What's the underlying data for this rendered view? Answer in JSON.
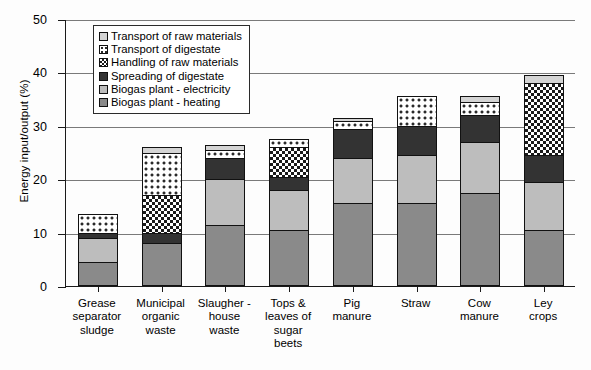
{
  "chart_data": {
    "type": "bar",
    "stacked": true,
    "title": "",
    "xlabel": "",
    "ylabel": "Energy input/output (%)",
    "ylim": [
      0,
      50
    ],
    "yticks": [
      0,
      10,
      20,
      30,
      40,
      50
    ],
    "grid": true,
    "legend_position": "upper left",
    "categories": [
      "Grease separator sludge",
      "Municipal organic waste",
      "Slaugher - house waste",
      "Tops & leaves of sugar beets",
      "Pig manure",
      "Straw",
      "Cow manure",
      "Ley crops"
    ],
    "series": [
      {
        "name": "Biogas plant - heating",
        "values": [
          4.5,
          8.0,
          11.5,
          10.5,
          15.5,
          15.5,
          17.5,
          10.5
        ]
      },
      {
        "name": "Biogas plant - electricity",
        "values": [
          4.5,
          0.0,
          8.5,
          7.5,
          8.5,
          9.0,
          9.5,
          9.0
        ]
      },
      {
        "name": "Spreading of digestate",
        "values": [
          1.0,
          2.0,
          4.0,
          2.5,
          5.5,
          5.5,
          5.0,
          5.0
        ]
      },
      {
        "name": "Handling of raw materials",
        "values": [
          0.0,
          7.0,
          0.0,
          5.5,
          0.0,
          0.0,
          0.0,
          13.5
        ]
      },
      {
        "name": "Transport of digestate",
        "values": [
          3.5,
          8.0,
          1.5,
          1.5,
          1.5,
          5.5,
          2.5,
          0.0
        ]
      },
      {
        "name": "Transport of raw materials",
        "values": [
          0.0,
          1.0,
          1.0,
          0.0,
          0.5,
          0.0,
          1.0,
          1.5
        ]
      }
    ],
    "totals": [
      13.5,
      26.0,
      26.5,
      27.5,
      31.5,
      35.5,
      35.5,
      39.5
    ]
  },
  "legend": {
    "items": [
      {
        "label": "Transport of raw materials",
        "pattern": "solid-light-gray",
        "color": "#d4d4d4"
      },
      {
        "label": "Transport of digestate",
        "pattern": "dots",
        "color": "#2a2a2a"
      },
      {
        "label": "Handling of raw materials",
        "pattern": "cross-hatch",
        "color": "#1a1a1a"
      },
      {
        "label": "Spreading of digestate",
        "pattern": "solid-dark",
        "color": "#333333"
      },
      {
        "label": "Biogas plant - electricity",
        "pattern": "solid-mid-gray",
        "color": "#bdbdbd"
      },
      {
        "label": "Biogas plant - heating",
        "pattern": "solid-gray",
        "color": "#8a8a8a"
      }
    ]
  },
  "axis": {
    "y_title": "Energy input/output (%)",
    "y_tick_labels": [
      "50",
      "40",
      "30",
      "20",
      "10",
      "0"
    ]
  },
  "category_labels": [
    [
      "Grease",
      "separator",
      "sludge"
    ],
    [
      "Municipal",
      "organic",
      "waste"
    ],
    [
      "Slaugher -",
      "house",
      "waste"
    ],
    [
      "Tops &",
      "leaves of",
      "sugar",
      "beets"
    ],
    [
      "Pig",
      "manure"
    ],
    [
      "Straw"
    ],
    [
      "Cow",
      "manure"
    ],
    [
      "Ley",
      "crops"
    ]
  ]
}
